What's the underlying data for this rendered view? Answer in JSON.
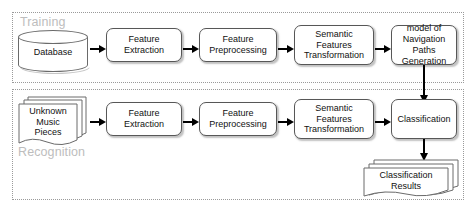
{
  "diagram": {
    "regions": [
      {
        "id": "training",
        "label": "Training"
      },
      {
        "id": "recognition",
        "label": "Recognition"
      }
    ],
    "training_flow": {
      "database": "Database",
      "feature_extraction": "Feature\nExtraction",
      "feature_preprocessing": "Feature\nPreprocessing",
      "semantic_features_transformation": "Semantic\nFeatures\nTransformation",
      "model_generation": "model of\nNavigation Paths\nGeneration"
    },
    "recognition_flow": {
      "unknown_music_pieces": "Unknown\nMusic\nPieces",
      "feature_extraction": "Feature\nExtraction",
      "feature_preprocessing": "Feature\nPreprocessing",
      "semantic_features_transformation": "Semantic\nFeatures\nTransformation",
      "classification": "Classification",
      "classification_results": "Classification\nResults"
    },
    "colors": {
      "node_border": "#575757",
      "node_fill": "#ffffff",
      "region_border": "#9a9a9a",
      "region_label": "#bdbdbd",
      "arrow": "#000000",
      "text": "#111111"
    }
  }
}
